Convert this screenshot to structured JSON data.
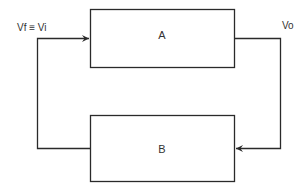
{
  "diagram": {
    "blocks": [
      {
        "id": "A",
        "label": "A"
      },
      {
        "id": "B",
        "label": "B"
      }
    ],
    "signals": {
      "input": "Vf ≡ Vi",
      "output": "Vo"
    },
    "colors": {
      "line": "#2a2a2a",
      "background": "#ffffff"
    }
  }
}
